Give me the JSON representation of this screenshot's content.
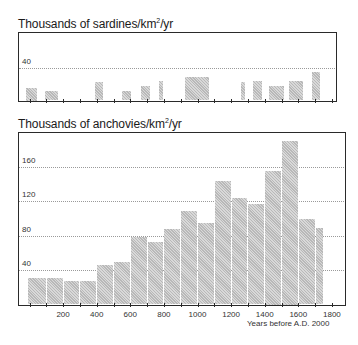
{
  "chart_data": [
    {
      "type": "bar",
      "title": "Thousands of sardines/km²/yr",
      "title_main": "Thousands of sardines/km",
      "title_sup": "2",
      "title_tail": "/yr",
      "xlabel": "Years before A.D. 2000",
      "ylabel": "Thousands of sardines/km²/yr",
      "yticks": [
        40
      ],
      "ylim": [
        0,
        48
      ],
      "xlim": [
        -70,
        1850
      ],
      "grid": true,
      "bars": [
        {
          "x0": -25,
          "x1": 50,
          "value": 15
        },
        {
          "x0": 90,
          "x1": 175,
          "value": 11
        },
        {
          "x0": 385,
          "x1": 440,
          "value": 22
        },
        {
          "x0": 550,
          "x1": 605,
          "value": 12
        },
        {
          "x0": 660,
          "x1": 720,
          "value": 17
        },
        {
          "x0": 765,
          "x1": 795,
          "value": 24
        },
        {
          "x0": 920,
          "x1": 1070,
          "value": 28
        },
        {
          "x0": 1255,
          "x1": 1285,
          "value": 22
        },
        {
          "x0": 1325,
          "x1": 1385,
          "value": 24
        },
        {
          "x0": 1425,
          "x1": 1515,
          "value": 17
        },
        {
          "x0": 1540,
          "x1": 1630,
          "value": 24
        },
        {
          "x0": 1680,
          "x1": 1735,
          "value": 34
        }
      ]
    },
    {
      "type": "bar",
      "title": "Thousands of anchovies/km²/yr",
      "title_main": "Thousands of anchovies/km",
      "title_sup": "2",
      "title_tail": "/yr",
      "xlabel": "Years before A.D. 2000",
      "ylabel": "Thousands of anchovies/km²/yr",
      "yticks": [
        40,
        80,
        120,
        160
      ],
      "xticks": [
        200,
        400,
        600,
        800,
        1000,
        1200,
        1400,
        1600,
        1800
      ],
      "ylim": [
        0,
        197
      ],
      "xlim": [
        -70,
        1850
      ],
      "grid": true,
      "categories": [
        "0-100",
        "100-200",
        "200-300",
        "300-400",
        "400-500",
        "500-600",
        "600-700",
        "700-800",
        "800-900",
        "900-1000",
        "1000-1100",
        "1100-1200",
        "1200-1300",
        "1300-1400",
        "1400-1500",
        "1500-1600",
        "1600-1700",
        "1700-1750"
      ],
      "values": [
        31,
        31,
        27,
        27,
        46,
        49,
        78,
        73,
        88,
        108,
        94,
        143,
        124,
        116,
        155,
        190,
        99,
        89
      ],
      "bars": [
        {
          "x0": -10,
          "x1": 100,
          "value": 31
        },
        {
          "x0": 100,
          "x1": 200,
          "value": 31
        },
        {
          "x0": 200,
          "x1": 300,
          "value": 27
        },
        {
          "x0": 300,
          "x1": 400,
          "value": 27
        },
        {
          "x0": 400,
          "x1": 500,
          "value": 46
        },
        {
          "x0": 500,
          "x1": 600,
          "value": 49
        },
        {
          "x0": 600,
          "x1": 700,
          "value": 78
        },
        {
          "x0": 700,
          "x1": 800,
          "value": 73
        },
        {
          "x0": 800,
          "x1": 900,
          "value": 88
        },
        {
          "x0": 900,
          "x1": 1000,
          "value": 108
        },
        {
          "x0": 1000,
          "x1": 1100,
          "value": 94
        },
        {
          "x0": 1100,
          "x1": 1200,
          "value": 143
        },
        {
          "x0": 1200,
          "x1": 1300,
          "value": 124
        },
        {
          "x0": 1300,
          "x1": 1400,
          "value": 116
        },
        {
          "x0": 1400,
          "x1": 1500,
          "value": 155
        },
        {
          "x0": 1500,
          "x1": 1600,
          "value": 190
        },
        {
          "x0": 1600,
          "x1": 1700,
          "value": 99
        },
        {
          "x0": 1700,
          "x1": 1750,
          "value": 89
        }
      ]
    }
  ]
}
